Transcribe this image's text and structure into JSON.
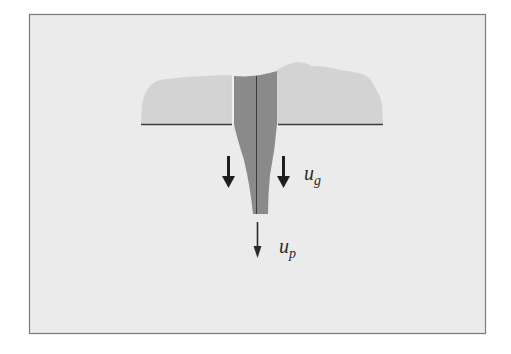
{
  "diagram": {
    "type": "schematic",
    "colors": {
      "page_background": "#ffffff",
      "frame_background": "#ebebeb",
      "frame_border": "#7a7a7a",
      "surface_body": "#d3d3d3",
      "stem": "#8a8a8a",
      "lines": "#3c3c3c",
      "arrows": "#1e1e1e"
    },
    "labels": {
      "gas_velocity": {
        "base": "u",
        "subscript": "g"
      },
      "particle_velocity": {
        "base": "u",
        "subscript": "p"
      }
    },
    "arrows": [
      {
        "name": "gas-flow-arrow-left",
        "direction": "down",
        "weight": "bold"
      },
      {
        "name": "gas-flow-arrow-right",
        "direction": "down",
        "weight": "bold"
      },
      {
        "name": "particle-velocity-arrow",
        "direction": "down",
        "weight": "thin"
      }
    ]
  }
}
